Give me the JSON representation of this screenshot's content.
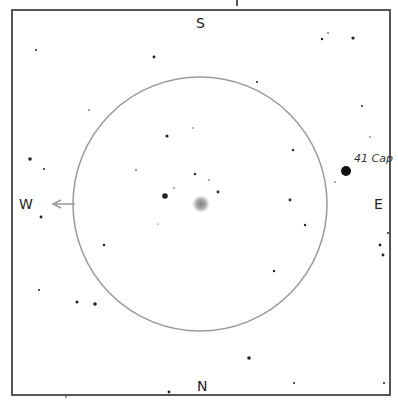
{
  "finder_chart": {
    "directions": {
      "top": "S",
      "bottom": "N",
      "left": "W",
      "right": "E"
    },
    "labels": {
      "bright_star": "41 Cap"
    },
    "colors": {
      "frame": "#555555",
      "circle": "#999999",
      "star": "#222222",
      "nebula": "#888888",
      "arrow": "#999999"
    },
    "field_circle": {
      "cx": 200,
      "cy": 204,
      "r": 127
    },
    "target": {
      "x": 201,
      "y": 204,
      "r": 7
    },
    "stars": [
      {
        "x": 36,
        "y": 50,
        "r": 1.0
      },
      {
        "x": 154,
        "y": 57,
        "r": 1.4
      },
      {
        "x": 322,
        "y": 39,
        "r": 1.2
      },
      {
        "x": 328,
        "y": 33,
        "r": 0.8
      },
      {
        "x": 353,
        "y": 38,
        "r": 1.6
      },
      {
        "x": 89,
        "y": 110,
        "r": 0.8
      },
      {
        "x": 257,
        "y": 82,
        "r": 1.0
      },
      {
        "x": 362,
        "y": 106,
        "r": 1.0
      },
      {
        "x": 370,
        "y": 137,
        "r": 0.7
      },
      {
        "x": 167,
        "y": 136,
        "r": 1.6
      },
      {
        "x": 193,
        "y": 128,
        "r": 0.7
      },
      {
        "x": 136,
        "y": 170,
        "r": 0.8
      },
      {
        "x": 195,
        "y": 174,
        "r": 1.2
      },
      {
        "x": 209,
        "y": 180,
        "r": 0.7
      },
      {
        "x": 218,
        "y": 192,
        "r": 1.4
      },
      {
        "x": 165,
        "y": 196,
        "r": 2.8
      },
      {
        "x": 174,
        "y": 188,
        "r": 0.7
      },
      {
        "x": 293,
        "y": 150,
        "r": 1.2
      },
      {
        "x": 305,
        "y": 225,
        "r": 1.2
      },
      {
        "x": 290,
        "y": 200,
        "r": 1.4
      },
      {
        "x": 335,
        "y": 182,
        "r": 0.7
      },
      {
        "x": 30,
        "y": 159,
        "r": 1.8
      },
      {
        "x": 44,
        "y": 169,
        "r": 1.0
      },
      {
        "x": 41,
        "y": 217,
        "r": 1.4
      },
      {
        "x": 104,
        "y": 245,
        "r": 1.2
      },
      {
        "x": 158,
        "y": 224,
        "r": 0.6
      },
      {
        "x": 274,
        "y": 271,
        "r": 1.2
      },
      {
        "x": 388,
        "y": 233,
        "r": 1.0
      },
      {
        "x": 380,
        "y": 245,
        "r": 1.4
      },
      {
        "x": 383,
        "y": 255,
        "r": 1.4
      },
      {
        "x": 39,
        "y": 290,
        "r": 1.0
      },
      {
        "x": 77,
        "y": 302,
        "r": 1.5
      },
      {
        "x": 95,
        "y": 304,
        "r": 1.8
      },
      {
        "x": 249,
        "y": 358,
        "r": 1.8
      },
      {
        "x": 294,
        "y": 383,
        "r": 1.0
      },
      {
        "x": 384,
        "y": 383,
        "r": 1.0
      },
      {
        "x": 169,
        "y": 392,
        "r": 1.4
      },
      {
        "x": 66,
        "y": 397,
        "r": 0.8
      }
    ],
    "bright_star": {
      "x": 346,
      "y": 171,
      "r": 5
    },
    "arrow": {
      "x1": 75,
      "y1": 204,
      "x2": 53,
      "y2": 204
    }
  }
}
